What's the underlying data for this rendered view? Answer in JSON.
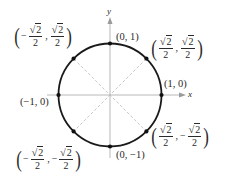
{
  "diagram": {
    "colors": {
      "circle": "#1a1a1a",
      "axes": "#b8b8b8",
      "diagonals": "#c4c4c4",
      "points": "#111111",
      "text": "#2a2a2a"
    },
    "axes": {
      "x_label": "x",
      "y_label": "y"
    },
    "points": [
      {
        "id": "p0",
        "label": "(1, 0)",
        "x": "1",
        "y": "0"
      },
      {
        "id": "p1",
        "label": "(√2/2, √2/2)",
        "x": "√2/2",
        "y": "√2/2"
      },
      {
        "id": "p2",
        "label": "(0, 1)",
        "x": "0",
        "y": "1"
      },
      {
        "id": "p3",
        "label": "(−√2/2, √2/2)",
        "x": "−√2/2",
        "y": "√2/2"
      },
      {
        "id": "p4",
        "label": "(−1, 0)",
        "x": "−1",
        "y": "0"
      },
      {
        "id": "p5",
        "label": "(−√2/2, −√2/2)",
        "x": "−√2/2",
        "y": "−√2/2"
      },
      {
        "id": "p6",
        "label": "(0, −1)",
        "x": "0",
        "y": "−1"
      },
      {
        "id": "p7",
        "label": "(√2/2, −√2/2)",
        "x": "√2/2",
        "y": "−√2/2"
      }
    ],
    "labels": {
      "one_zero": "(1, 0)",
      "zero_one": "(0, 1)",
      "neg_one_zero": "(−1, 0)",
      "zero_neg_one": "(0, −1)",
      "sqrt_radicand": "2",
      "denominator": "2",
      "minus": "−",
      "comma": ",",
      "lparen": "(",
      "rparen": ")",
      "sqrt_sign": "√"
    }
  }
}
